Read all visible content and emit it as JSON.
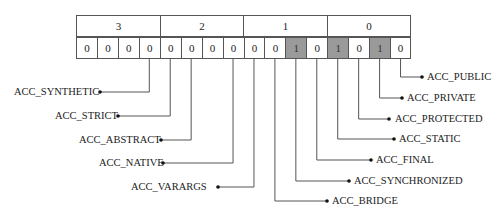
{
  "groups": [
    {
      "label": "3"
    },
    {
      "label": "2"
    },
    {
      "label": "1"
    },
    {
      "label": "0"
    }
  ],
  "bits": [
    "0",
    "0",
    "0",
    "0",
    "0",
    "0",
    "0",
    "0",
    "0",
    "0",
    "1",
    "0",
    "1",
    "0",
    "1",
    "0"
  ],
  "set_color": "#9a9a9a",
  "flags": [
    {
      "name": "ACC_SYNTHETIC",
      "bit_index": 3,
      "side": "left",
      "y": 92,
      "label_x": 14,
      "dot_x": 100
    },
    {
      "name": "ACC_STRICT",
      "bit_index": 4,
      "side": "left",
      "y": 116,
      "label_x": 55,
      "dot_x": 118
    },
    {
      "name": "ACC_ABSTRACT",
      "bit_index": 5,
      "side": "left",
      "y": 140,
      "label_x": 79,
      "dot_x": 161
    },
    {
      "name": "ACC_NATIVE",
      "bit_index": 7,
      "side": "left",
      "y": 163,
      "label_x": 99,
      "dot_x": 163
    },
    {
      "name": "ACC_VARARGS",
      "bit_index": 8,
      "side": "left",
      "y": 187,
      "label_x": 131,
      "dot_x": 218
    },
    {
      "name": "ACC_BRIDGE",
      "bit_index": 9,
      "side": "right",
      "y": 201,
      "label_x": 332,
      "dot_x": 327
    },
    {
      "name": "ACC_SYNCHRONIZED",
      "bit_index": 10,
      "side": "right",
      "y": 181,
      "label_x": 354,
      "dot_x": 349
    },
    {
      "name": "ACC_FINAL",
      "bit_index": 11,
      "side": "right",
      "y": 160,
      "label_x": 376,
      "dot_x": 371
    },
    {
      "name": "ACC_STATIC",
      "bit_index": 12,
      "side": "right",
      "y": 139,
      "label_x": 399,
      "dot_x": 394
    },
    {
      "name": "ACC_PROTECTED",
      "bit_index": 13,
      "side": "right",
      "y": 119,
      "label_x": 395,
      "dot_x": 389
    },
    {
      "name": "ACC_PRIVATE",
      "bit_index": 14,
      "side": "right",
      "y": 98,
      "label_x": 407,
      "dot_x": 402
    },
    {
      "name": "ACC_PUBLIC",
      "bit_index": 15,
      "side": "right",
      "y": 77,
      "label_x": 427,
      "dot_x": 422
    }
  ]
}
